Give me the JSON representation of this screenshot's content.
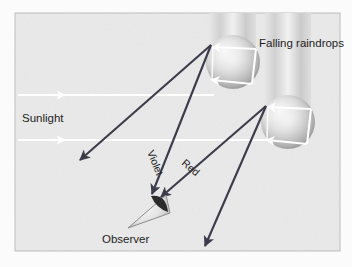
{
  "figure": {
    "background_color": "#e9e9e9",
    "frame_color": "#b9b9b9",
    "ray_color": "#3b3b4a",
    "sunlight_color": "#ffffff"
  },
  "labels": {
    "sunlight": "Sunlight",
    "falling_raindrops": "Falling raindrops",
    "violet": "Violet",
    "red": "Red",
    "observer": "Observer"
  },
  "diagram_data": {
    "type": "diagram",
    "sunlight_rays": [
      {
        "name": "upper-sunlight-ray",
        "x1": 18,
        "y1": 95,
        "x2": 214,
        "y2": 95,
        "arrow_at": 62
      },
      {
        "name": "lower-sunlight-ray",
        "x1": 18,
        "y1": 140,
        "x2": 268,
        "y2": 140,
        "arrow_at": 62
      }
    ],
    "raindrops": [
      {
        "name": "upper-raindrop",
        "cx": 233,
        "cy": 62,
        "r": 27,
        "trail_top": 8
      },
      {
        "name": "lower-raindrop",
        "cx": 288,
        "cy": 122,
        "r": 27,
        "trail_top": 68
      }
    ],
    "light_paths": [
      {
        "name": "violet-ray",
        "from": "upper-raindrop",
        "to": "observer",
        "x1": 211,
        "y1": 45,
        "x2": 151,
        "y2": 196,
        "label": "Violet"
      },
      {
        "name": "upper-drop-lower-ray",
        "from": "upper-raindrop",
        "to": "lower-left",
        "x1": 211,
        "y1": 45,
        "x2": 78,
        "y2": 162
      },
      {
        "name": "red-ray",
        "from": "lower-raindrop",
        "to": "observer",
        "x1": 266,
        "y1": 106,
        "x2": 160,
        "y2": 199,
        "label": "Red"
      },
      {
        "name": "lower-drop-lower-ray",
        "from": "lower-raindrop",
        "to": "bottom-right",
        "x1": 266,
        "y1": 106,
        "x2": 205,
        "y2": 248
      }
    ],
    "observer": {
      "name": "observer-eye",
      "x": 150,
      "y": 197,
      "apex_x": 128,
      "apex_y": 228
    },
    "label_positions": {
      "sunlight": {
        "x": 22,
        "y": 122,
        "rotation": 0
      },
      "falling_raindrops": {
        "x": 259,
        "y": 47,
        "rotation": 0
      },
      "violet": {
        "x": 151,
        "y": 158,
        "rotation": 68
      },
      "red": {
        "x": 184,
        "y": 170,
        "rotation": 41
      },
      "observer": {
        "x": 102,
        "y": 243,
        "rotation": 0
      }
    }
  }
}
